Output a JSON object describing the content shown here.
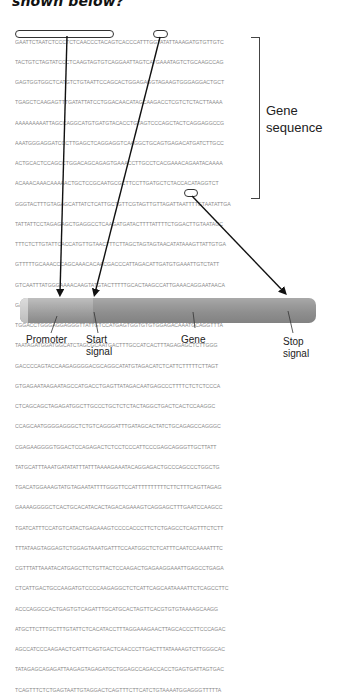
{
  "question": {
    "tail_text": "shown below?"
  },
  "sequence": {
    "lines": [
      "GAATTCTAATCTCCCTCTCAACCCTACAGTCACCCATTTGGTATATTAAAGATGTGTTGTC",
      "TACTGTCTAGTATCCCTCAAGTAGTGTCAGGAATTAGTCATGAAATAGTCTGCAAGCCAG",
      "GAGTGGTGGCTCATGTCTGTAATTCCAGCACTGGAGAGGTAGAAGTGGGAGGACTGCT",
      "TGAGCTCAAGAGTTTGATATTATCCTGGACAACATAGCAAGACCTCGTCTCTACTTAAAA",
      "AAAAAAAAATTAGCCAGGCATGTGATGTACACCTGTAGTCCCAGCTACTCAGGAGGCCG",
      "AAATGGGAGGATCCCTTGAGCTCAGGAGGTCAAGGCTGCAGTGAGACATGATCTTGCC",
      "ACTGCACTCCAGCCTGGACAGCAGAGTGAAACCTTGCCTCACGAAACAGAATACAAAA",
      "ACAAACAAACAAAAACTGCTCCGCAATGCGCTTCCTTGATGCTCTACCACATAGGTCT",
      "GGGTACTTTGTAGAGCATTATCTCATTGCTGTTCGTAGTTGTTAGATTAATTTTGTAATATTGA",
      "TATTATTCCTAGAGAGCTGAGGCCTCAAGATGATACTTTTATTTTCTGGACTTGTAATAGC",
      "TTTCTCTTGTATTCACCATGTTGTAACTTTCTTAGCTAGTAGTAACATATAAAGTTATTGTGA",
      "GTTTTTGCAAACCCAGCAAACACAACGACCCATTAGACATTGATGTGAAATTGTCTATT",
      "GTCAATTTATGGGAAAACAAGTATGTACTTTTTGCACTAAGCCATTGAAACAGGAATAACA",
      "GAACAAGATTGAAAGAATACATTTCCGAAATTCTTGAGTATTATACAAAGACAAGCACG",
      "TGGACCTGGGAGGAGGGTTATTGTCCATGAGTGGTGTGTGGAGACAAATGCAGGTTTA",
      "TAATAGATGGATGGCATCTAGCGCAATGACTTTGCCATCACTTTAGAGAGCTCTTGGG",
      "GACCCCAGTACCAAGAGGGGACGCAGGCATATGTAGACATCTCATTCTTTTTCTTAGT",
      "GTGAGAATAAGAATAGCCATGACCTGAGTTATAGACAATGAGCCCTTTTCTCTCTCCCA",
      "CTCAGCAGCTAGAGATGGCTTGCCCTGCTCTCTACTAGGCTGACTCACTCCAAGGC",
      "CCAGCAATGGGGAGGGCTCTGTCAGGGATTTGATAGCACTATCTGCAGAGCCAGGGC",
      "CGAGAAGGGGTGGACTCCAGAGACTCTCCTCCCATTCCCGAGCAGGGTTGCTTATT",
      "TATGCATTTAAATGATATATTTATTTAAAAGAAATACAGGAGACTGCCCAGCCCTGGCTG",
      "TGACATGGAAAGTATGTAGAATATTTTGGGTTCCATTTTTTTTTTCTTCTTTCAGTTAGAG",
      "GAAAAGGGGCTCACTGCACATACACTAGACAGAAAGTCAGGAGCTTTGAATCCAAGCC",
      "TGATCATTTCCATGTCATACTGAGAAAGTCCCCACCCTTCTCTGAGCCTCAGTTTCTCTT",
      "TTTATAAGTAGGAGTCTGGAGTAAATGATTTCCAATGGCTCTCATTTCAATCCAAAATTTC",
      "CGTTTATTAAATACATGAGCTTCTGTTACTCCAAGACTGAGAAGGAAATTGAGCCTGAGA",
      "CTCATTGACTGCCAAGATGTCCCCAAGAGGCTCTCATTCAGCAATAAAATTCTCAGCCTTC",
      "ACCCAGGCCACTGAGTGTCAGATTTGCATGCACTAGTTCACGTGTGTAAAAGCAAGG",
      "ATGCTTCTTTGCTTTGTATTCTCACATACCTTTAGGAAAGAACTTAGCACCCTTCCCAGAC",
      "AGCCATCCCAAGAACTCATTTCAGTGACTCAACCCTTGACTTTATAAAAGTCTTGGGCAC",
      "TATAGAGCAGAGATTAAGAGTAGAGATGCTGGAGCCAGACCACCTGAGTGATTAGTGAC",
      "TCAGTTTCTCTGAGTAATTGTAGGACTCAGTTTCTTCATCTGTAAAATGGAGGGTTTTTA"
    ]
  },
  "bracket": {
    "label_line1": "Gene",
    "label_line2": "sequence"
  },
  "gene_bar": {
    "labels": {
      "promoter": "Promoter",
      "start_line1": "Start",
      "start_line2": "signal",
      "gene": "Gene",
      "stop_line1": "Stop",
      "stop_line2": "signal"
    }
  },
  "colors": {
    "sequence_text": "#8a8a8a",
    "arrow": "#111111",
    "bar_body": "#9a9a9a",
    "bar_cap": "#d6d6d6"
  }
}
